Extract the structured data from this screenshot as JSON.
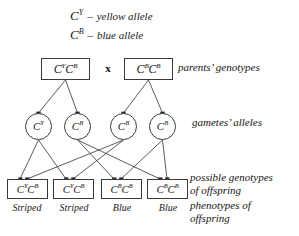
{
  "diagram": {
    "title_present": false,
    "legend": [
      {
        "symbol": "C",
        "superscript": "Y",
        "separator": "–",
        "text": "yellow allele"
      },
      {
        "symbol": "C",
        "superscript": "B",
        "separator": "–",
        "text": "blue allele"
      }
    ],
    "cross_symbol": "x",
    "parents": {
      "label": "parents’ genotypes",
      "genotypes": [
        {
          "allele1": {
            "symbol": "C",
            "superscript": "Y"
          },
          "allele2": {
            "symbol": "C",
            "superscript": "B"
          }
        },
        {
          "allele1": {
            "symbol": "C",
            "superscript": "B"
          },
          "allele2": {
            "symbol": "C",
            "superscript": "B"
          }
        }
      ]
    },
    "gametes": {
      "label": "gametes’ alleles",
      "alleles": [
        {
          "symbol": "C",
          "superscript": "Y"
        },
        {
          "symbol": "C",
          "superscript": "B"
        },
        {
          "symbol": "C",
          "superscript": "B"
        },
        {
          "symbol": "C",
          "superscript": "B"
        }
      ]
    },
    "offspring": {
      "genotypes_label": "possible genotypes\nof offspring",
      "phenotypes_label": "phenotypes of\noffspring",
      "genotypes": [
        {
          "allele1": {
            "symbol": "C",
            "superscript": "Y"
          },
          "allele2": {
            "symbol": "C",
            "superscript": "B"
          }
        },
        {
          "allele1": {
            "symbol": "C",
            "superscript": "Y"
          },
          "allele2": {
            "symbol": "C",
            "superscript": "B"
          }
        },
        {
          "allele1": {
            "symbol": "C",
            "superscript": "B"
          },
          "allele2": {
            "symbol": "C",
            "superscript": "B"
          }
        },
        {
          "allele1": {
            "symbol": "C",
            "superscript": "B"
          },
          "allele2": {
            "symbol": "C",
            "superscript": "B"
          }
        }
      ],
      "phenotypes": [
        "Striped",
        "Striped",
        "Blue",
        "Blue"
      ]
    },
    "colors": {
      "ink": "#141414",
      "line": "#4a4a4a",
      "box_border": "#3a3a3a",
      "background": "#ffffff"
    }
  }
}
